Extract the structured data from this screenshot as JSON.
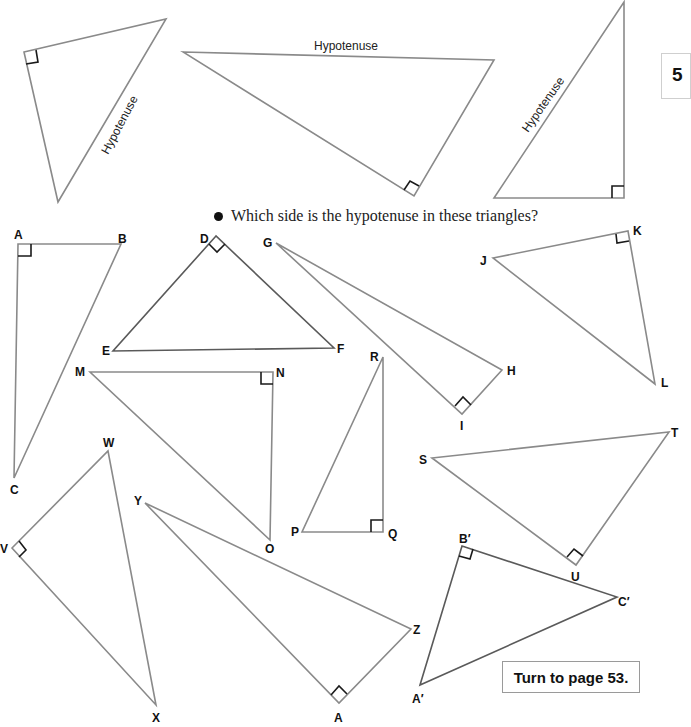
{
  "page": {
    "page_number_tab": "5",
    "question": "Which side is the hypotenuse in these triangles?",
    "turn_to_page": "Turn to page 53.",
    "colors": {
      "line": "#8a8a8a",
      "right_angle_mark": "#1a1a1a",
      "text": "#111111"
    }
  },
  "examples": [
    {
      "id": "ex1",
      "hypotenuse_label": "Hypotenuse",
      "points": "30,55 166,19 58,202",
      "right_angle_at": [
        30,
        55
      ]
    },
    {
      "id": "ex2",
      "hypotenuse_label": "Hypotenuse",
      "points": "183,52 494,60 412,196",
      "right_angle_at": [
        412,
        196
      ]
    },
    {
      "id": "ex3",
      "hypotenuse_label": "Hypotenuse",
      "points": "624,2 623,198 494,198",
      "right_angle_at": [
        623,
        198
      ]
    }
  ],
  "triangles": [
    {
      "id": "ABC",
      "vertices": [
        {
          "name": "A",
          "label": "A"
        },
        {
          "name": "B",
          "label": "B"
        },
        {
          "name": "C",
          "label": "C"
        }
      ],
      "right_angle": "A"
    },
    {
      "id": "DEF",
      "vertices": [
        {
          "name": "D",
          "label": "D"
        },
        {
          "name": "E",
          "label": "E"
        },
        {
          "name": "F",
          "label": "F"
        }
      ],
      "right_angle": "D"
    },
    {
      "id": "GHI",
      "vertices": [
        {
          "name": "G",
          "label": "G"
        },
        {
          "name": "H",
          "label": "H"
        },
        {
          "name": "I",
          "label": "I"
        }
      ],
      "right_angle": "I"
    },
    {
      "id": "JKL",
      "vertices": [
        {
          "name": "J",
          "label": "J"
        },
        {
          "name": "K",
          "label": "K"
        },
        {
          "name": "L",
          "label": "L"
        }
      ],
      "right_angle": "K"
    },
    {
      "id": "MNO",
      "vertices": [
        {
          "name": "M",
          "label": "M"
        },
        {
          "name": "N",
          "label": "N"
        },
        {
          "name": "O",
          "label": "O"
        }
      ],
      "right_angle": "N"
    },
    {
      "id": "PQR",
      "vertices": [
        {
          "name": "P",
          "label": "P"
        },
        {
          "name": "Q",
          "label": "Q"
        },
        {
          "name": "R",
          "label": "R"
        }
      ],
      "right_angle": "Q"
    },
    {
      "id": "STU",
      "vertices": [
        {
          "name": "S",
          "label": "S"
        },
        {
          "name": "T",
          "label": "T"
        },
        {
          "name": "U",
          "label": "U"
        }
      ],
      "right_angle": "U"
    },
    {
      "id": "VWX",
      "vertices": [
        {
          "name": "V",
          "label": "V"
        },
        {
          "name": "W",
          "label": "W"
        },
        {
          "name": "X",
          "label": "X"
        }
      ],
      "right_angle": "V"
    },
    {
      "id": "YZA",
      "vertices": [
        {
          "name": "Y",
          "label": "Y"
        },
        {
          "name": "Z",
          "label": "Z"
        },
        {
          "name": "A",
          "label": "A"
        }
      ],
      "right_angle": "A"
    },
    {
      "id": "A'B'C'",
      "vertices": [
        {
          "name": "A'",
          "label": "A′"
        },
        {
          "name": "B'",
          "label": "B′"
        },
        {
          "name": "C'",
          "label": "C′"
        }
      ],
      "right_angle": "B'"
    }
  ]
}
